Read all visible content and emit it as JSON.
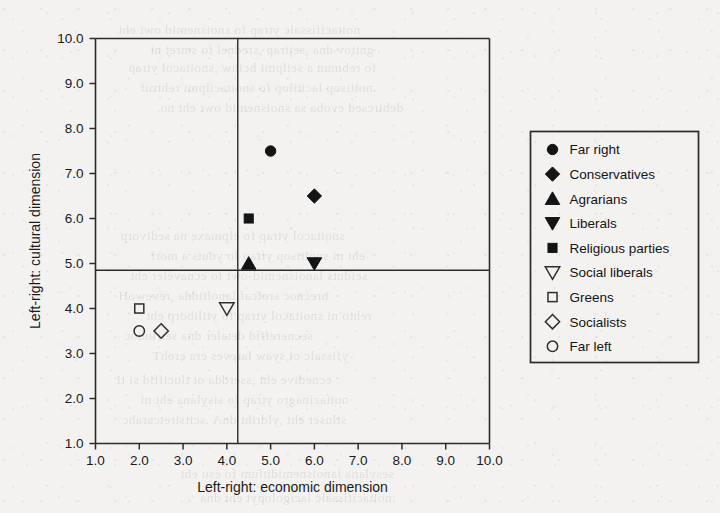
{
  "figure": {
    "background_color": "#f3f2f0",
    "ink_color": "#141414"
  },
  "axes": {
    "x": {
      "title": "Left-right: economic dimension",
      "min": 1.0,
      "max": 10.0,
      "ticks": [
        "1.0",
        "2.0",
        "3.0",
        "4.0",
        "5.0",
        "6.0",
        "7.0",
        "8.0",
        "9.0",
        "10.0"
      ],
      "tick_values": [
        1.0,
        2.0,
        3.0,
        4.0,
        5.0,
        6.0,
        7.0,
        8.0,
        9.0,
        10.0
      ]
    },
    "y": {
      "title": "Left-right: cultural dimension",
      "min": 1.0,
      "max": 10.0,
      "ticks": [
        "1.0",
        "2.0",
        "3.0",
        "4.0",
        "5.0",
        "6.0",
        "7.0",
        "8.0",
        "9.0",
        "10.0"
      ],
      "tick_values": [
        1.0,
        2.0,
        3.0,
        4.0,
        5.0,
        6.0,
        7.0,
        8.0,
        9.0,
        10.0
      ]
    }
  },
  "reference_lines": {
    "vertical_x": 4.25,
    "horizontal_y": 4.85
  },
  "legend": {
    "position": "right",
    "entries": [
      {
        "label": "Far right",
        "marker": "circle-filled"
      },
      {
        "label": "Conservatives",
        "marker": "diamond-filled"
      },
      {
        "label": "Agrarians",
        "marker": "triangle-up-filled"
      },
      {
        "label": "Liberals",
        "marker": "triangle-down-filled"
      },
      {
        "label": "Religious parties",
        "marker": "square-filled"
      },
      {
        "label": "Social liberals",
        "marker": "triangle-down-open"
      },
      {
        "label": "Greens",
        "marker": "square-open"
      },
      {
        "label": "Socialists",
        "marker": "diamond-open"
      },
      {
        "label": "Far left",
        "marker": "circle-open"
      }
    ]
  },
  "chart_data": {
    "type": "scatter",
    "title": "",
    "xlabel": "Left-right: economic dimension",
    "ylabel": "Left-right: cultural dimension",
    "xlim": [
      1.0,
      10.0
    ],
    "ylim": [
      1.0,
      10.0
    ],
    "grid": false,
    "legend_position": "right",
    "points": [
      {
        "name": "Far right",
        "x": 5.0,
        "y": 7.5,
        "marker": "circle-filled"
      },
      {
        "name": "Conservatives",
        "x": 6.0,
        "y": 6.5,
        "marker": "diamond-filled"
      },
      {
        "name": "Religious parties",
        "x": 4.5,
        "y": 6.0,
        "marker": "square-filled"
      },
      {
        "name": "Agrarians",
        "x": 4.5,
        "y": 5.0,
        "marker": "triangle-up-filled"
      },
      {
        "name": "Liberals",
        "x": 6.0,
        "y": 5.0,
        "marker": "triangle-down-filled"
      },
      {
        "name": "Social liberals",
        "x": 4.0,
        "y": 4.0,
        "marker": "triangle-down-open"
      },
      {
        "name": "Greens",
        "x": 2.0,
        "y": 4.0,
        "marker": "square-open"
      },
      {
        "name": "Socialists",
        "x": 2.5,
        "y": 3.5,
        "marker": "diamond-open"
      },
      {
        "name": "Far left",
        "x": 2.0,
        "y": 3.5,
        "marker": "circle-open"
      }
    ],
    "annotations": [
      {
        "type": "vline",
        "x": 4.25
      },
      {
        "type": "hline",
        "y": 4.85
      }
    ]
  }
}
